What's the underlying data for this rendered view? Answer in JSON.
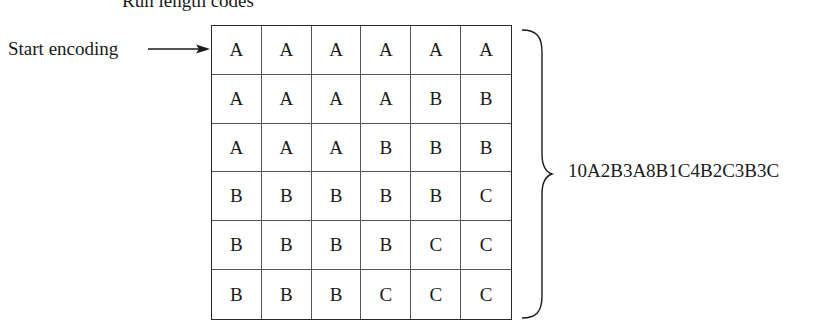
{
  "title": "Run length codes",
  "start_label": "Start encoding",
  "grid": {
    "rows": [
      [
        "A",
        "A",
        "A",
        "A",
        "A",
        "A"
      ],
      [
        "A",
        "A",
        "A",
        "A",
        "B",
        "B"
      ],
      [
        "A",
        "A",
        "A",
        "B",
        "B",
        "B"
      ],
      [
        "B",
        "B",
        "B",
        "B",
        "B",
        "C"
      ],
      [
        "B",
        "B",
        "B",
        "B",
        "C",
        "C"
      ],
      [
        "B",
        "B",
        "B",
        "C",
        "C",
        "C"
      ]
    ]
  },
  "encoded_output": "10A2B3A8B1C4B2C3B3C",
  "icons": {
    "arrow": "right-arrow-icon",
    "brace": "right-curly-brace-icon"
  }
}
